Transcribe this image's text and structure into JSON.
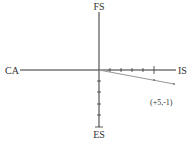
{
  "diagram": {
    "axes": {
      "top_label": "FS",
      "bottom_label": "ES",
      "left_label": "CA",
      "right_label": "IS"
    },
    "vector": {
      "label": "(+5,-1)",
      "x": 5,
      "y": -1
    },
    "ticks": {
      "positive_x_count": 5,
      "negative_y_count": 5
    },
    "colors": {
      "axis": "#333333",
      "vector": "#999999"
    }
  }
}
